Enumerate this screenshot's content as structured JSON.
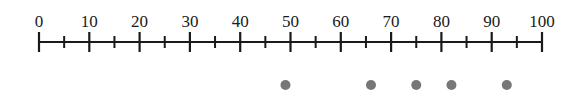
{
  "chart_data": {
    "type": "scatter",
    "title": "",
    "xlabel": "",
    "ylabel": "",
    "xlim": [
      0,
      100
    ],
    "major_ticks": [
      0,
      10,
      20,
      30,
      40,
      50,
      60,
      70,
      80,
      90,
      100
    ],
    "minor_ticks": [
      5,
      15,
      25,
      35,
      45,
      55,
      65,
      75,
      85,
      95
    ],
    "tick_labels": [
      "0",
      "10",
      "20",
      "30",
      "40",
      "50",
      "60",
      "70",
      "80",
      "90",
      "100"
    ],
    "points": [
      49,
      66,
      75,
      82,
      93
    ],
    "grid": false,
    "legend": null
  },
  "style": {
    "axis_color": "#1a1a1a",
    "dot_color": "#777777",
    "x_pixel_start": 39,
    "x_pixel_end": 542,
    "axis_y": 42,
    "dot_y": 85,
    "dot_radius": 5
  }
}
